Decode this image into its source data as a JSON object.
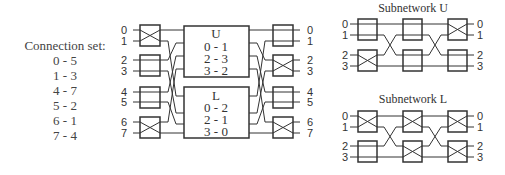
{
  "connection_set": {
    "title": "Connection set:",
    "pairs": [
      "0 - 5",
      "1 - 3",
      "4 - 7",
      "5 - 2",
      "6 - 1",
      "7 - 4"
    ]
  },
  "main_network": {
    "input_labels": [
      "0",
      "1",
      "2",
      "3",
      "4",
      "5",
      "6",
      "7"
    ],
    "output_labels": [
      "0",
      "1",
      "2",
      "3",
      "4",
      "5",
      "6",
      "7"
    ],
    "input_switches": [
      "cross",
      "straight",
      "straight",
      "cross"
    ],
    "output_switches": [
      "straight",
      "cross",
      "straight",
      "cross"
    ],
    "upper_block": {
      "title": "U",
      "pairs": [
        "0 - 1",
        "2 - 3",
        "3 - 2"
      ]
    },
    "lower_block": {
      "title": "L",
      "pairs": [
        "0 - 2",
        "2 - 1",
        "3 - 0"
      ]
    }
  },
  "subnetwork_u": {
    "title": "Subnetwork U",
    "input_labels": [
      "0",
      "1",
      "2",
      "3"
    ],
    "output_labels": [
      "0",
      "1",
      "2",
      "3"
    ],
    "switches": [
      [
        "straight",
        "cross"
      ],
      [
        "straight",
        "straight"
      ],
      [
        "cross",
        "straight"
      ]
    ]
  },
  "subnetwork_l": {
    "title": "Subnetwork L",
    "input_labels": [
      "0",
      "1",
      "2",
      "3"
    ],
    "output_labels": [
      "0",
      "1",
      "2",
      "3"
    ],
    "switches": [
      [
        "cross",
        "straight"
      ],
      [
        "cross",
        "cross"
      ],
      [
        "cross",
        "cross"
      ]
    ]
  },
  "colors": {
    "line": "#333333",
    "text": "#444444",
    "background": "#ffffff"
  }
}
